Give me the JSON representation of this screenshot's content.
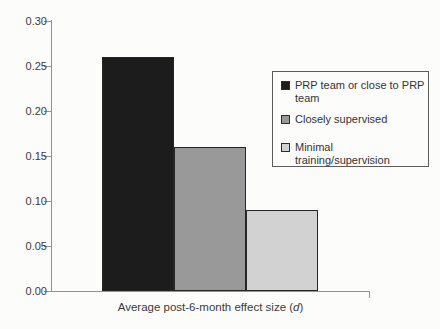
{
  "chart_data": {
    "type": "bar",
    "title": "",
    "xlabel": "Average post-6-month effect size (d)",
    "xlabel_parts": {
      "prefix": "Average post-6-month effect size (",
      "italic": "d",
      "suffix": ")"
    },
    "ylabel": "",
    "ylim": [
      0,
      0.3
    ],
    "ytick_step": 0.05,
    "yticks": [
      "0.00",
      "0.05",
      "0.10",
      "0.15",
      "0.20",
      "0.25",
      "0.30"
    ],
    "grid": false,
    "legend_position": "inside-top-right",
    "categories": [
      "Average post-6-month effect size (d)"
    ],
    "series": [
      {
        "key": "prp-team",
        "name": "PRP team or close to PRP team",
        "value": 0.26,
        "color": "#1c1c1c"
      },
      {
        "key": "closely-supervised",
        "name": "Closely supervised",
        "value": 0.16,
        "color": "#999999"
      },
      {
        "key": "minimal-training",
        "name": "Minimal training/supervision",
        "value": 0.09,
        "color": "#d2d2d2"
      }
    ],
    "colors": {
      "axis": "#929292",
      "bar_border": "#262626",
      "legend_border": "#5c5c5c",
      "text": "#3b3b3b"
    }
  }
}
